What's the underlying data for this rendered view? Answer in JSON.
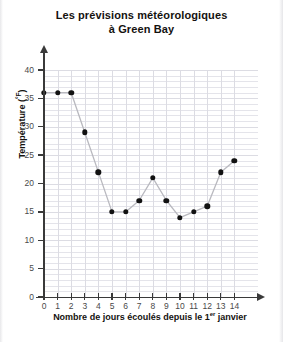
{
  "title": {
    "line1": "Les prévisions météorologiques",
    "line2": "à Green Bay"
  },
  "axes": {
    "y_title": "Température (",
    "y_unit": "°F",
    "y_title_close": ")",
    "x_title_a": "Nombre de jours écoulés depuis le 1",
    "x_title_sup": "er",
    "x_title_b": " janvier"
  },
  "colors": {
    "ink": "#121212",
    "grid": "#e4e4ea",
    "axis": "#3a3a3a",
    "tick_text": "#4a4a4a",
    "background": "#ffffff"
  },
  "chart_data": {
    "type": "line",
    "title": "Les prévisions météorologiques à Green Bay",
    "xlabel": "Nombre de jours écoulés depuis le 1er janvier",
    "ylabel": "Température (°F)",
    "x": [
      0,
      1,
      2,
      3,
      4,
      5,
      6,
      7,
      8,
      9,
      10,
      11,
      12,
      13,
      14
    ],
    "values": [
      36,
      36,
      36,
      29,
      22,
      15,
      15,
      17,
      21,
      17,
      14,
      15,
      16,
      22,
      24
    ],
    "xlim": [
      0,
      14
    ],
    "ylim": [
      0,
      40
    ],
    "xticks": [
      0,
      1,
      2,
      3,
      4,
      5,
      6,
      7,
      8,
      9,
      10,
      11,
      12,
      13,
      14
    ],
    "yticks": [
      0,
      5,
      10,
      15,
      20,
      25,
      30,
      35,
      40
    ],
    "xtick_labels": [
      "0",
      "1",
      "2",
      "3",
      "4",
      "5",
      "6",
      "7",
      "8",
      "9",
      "10",
      "11",
      "12",
      "13",
      "14"
    ],
    "ytick_labels": [
      "0",
      "5",
      "10",
      "15",
      "20",
      "25",
      "30",
      "35",
      "40"
    ],
    "grid": true,
    "grid_step_y": 1,
    "grid_step_x": 1,
    "legend": null,
    "marker": "filled-circle",
    "marker_color": "#121212",
    "line_color": "#b9b9bf"
  }
}
